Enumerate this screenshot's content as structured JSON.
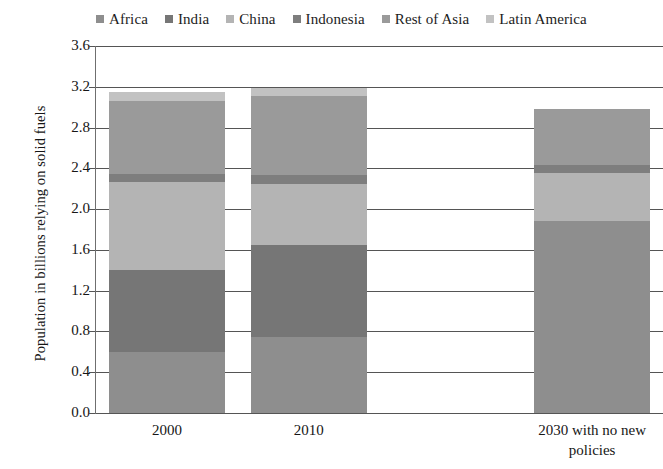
{
  "chart_data": {
    "type": "bar",
    "subtype": "stacked-column",
    "title": "",
    "xlabel": "",
    "ylabel": "Population in billions relying on solid fuels",
    "ylim": [
      0.0,
      3.6
    ],
    "ytick_labels": [
      "3.6",
      "3.2",
      "2.8",
      "2.4",
      "2.0",
      "1.6",
      "1.2",
      "0.8",
      "0.4",
      "0.0"
    ],
    "ytick_values": [
      3.6,
      3.2,
      2.8,
      2.4,
      2.0,
      1.6,
      1.2,
      0.8,
      0.4,
      0.0
    ],
    "grid": true,
    "grid_axis": "y",
    "legend_position": "top",
    "categories": [
      "2000",
      "2010",
      "",
      "2030 with no new policies"
    ],
    "category_display": [
      "2000",
      "2010",
      "",
      "2030 with no new\npolicies"
    ],
    "series": [
      {
        "name": "Africa",
        "color": "#8e8e8e",
        "values": [
          0.6,
          0.75,
          0.0,
          1.88
        ]
      },
      {
        "name": "India",
        "color": "#767676",
        "values": [
          0.8,
          0.9,
          0.0,
          0.0
        ]
      },
      {
        "name": "China",
        "color": "#b4b4b4",
        "values": [
          0.87,
          0.6,
          0.0,
          0.47
        ]
      },
      {
        "name": "Indonesia",
        "color": "#7e7e7e",
        "values": [
          0.07,
          0.08,
          0.0,
          0.08
        ]
      },
      {
        "name": "Rest of Asia",
        "color": "#9a9a9a",
        "values": [
          0.72,
          0.78,
          0.0,
          0.55
        ]
      },
      {
        "name": "Latin America",
        "color": "#c2c2c2",
        "values": [
          0.09,
          0.08,
          0.0,
          0.0
        ]
      }
    ],
    "totals": [
      3.15,
      3.19,
      0.0,
      2.98
    ]
  },
  "legend": {
    "items": [
      {
        "label": "Africa",
        "color": "#8e8e8e"
      },
      {
        "label": "India",
        "color": "#767676"
      },
      {
        "label": "China",
        "color": "#b4b4b4"
      },
      {
        "label": "Indonesia",
        "color": "#7e7e7e"
      },
      {
        "label": "Rest of Asia",
        "color": "#9a9a9a"
      },
      {
        "label": "Latin America",
        "color": "#c2c2c2"
      }
    ]
  },
  "axes": {
    "y_title": "Population in billions relying on solid fuels"
  }
}
